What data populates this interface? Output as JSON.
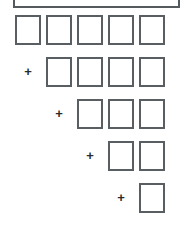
{
  "figure": {
    "type": "staircase-rectangle-diagram",
    "background_color": "#ffffff",
    "stroke_color": "#595e62",
    "plus_color": "#2b2b2b",
    "canvas": {
      "width": 189,
      "height": 228
    }
  },
  "top_bar": {
    "label": "",
    "x": 13,
    "y": -14,
    "width": 167,
    "height": 22,
    "cropped": "top"
  },
  "geometry": {
    "cell_width": 26,
    "cell_height": 30,
    "column_pitch": 31,
    "row_pitch": 42,
    "origin_x": 15,
    "origin_y": 15
  },
  "rows": [
    {
      "index": 0,
      "operator": "",
      "has_operator": false,
      "cell_count": 5,
      "column_offset": 0,
      "y": 15,
      "cells": [
        {
          "label": "",
          "column": 0
        },
        {
          "label": "",
          "column": 1
        },
        {
          "label": "",
          "column": 2
        },
        {
          "label": "",
          "column": 3
        },
        {
          "label": "",
          "column": 4
        }
      ]
    },
    {
      "index": 1,
      "operator": "+",
      "has_operator": true,
      "operator_x": 22,
      "cell_count": 4,
      "column_offset": 1,
      "y": 57,
      "cells": [
        {
          "label": "",
          "column": 1
        },
        {
          "label": "",
          "column": 2
        },
        {
          "label": "",
          "column": 3
        },
        {
          "label": "",
          "column": 4
        }
      ]
    },
    {
      "index": 2,
      "operator": "+",
      "has_operator": true,
      "operator_x": 53,
      "cell_count": 3,
      "column_offset": 2,
      "y": 99,
      "cells": [
        {
          "label": "",
          "column": 2
        },
        {
          "label": "",
          "column": 3
        },
        {
          "label": "",
          "column": 4
        }
      ]
    },
    {
      "index": 3,
      "operator": "+",
      "has_operator": true,
      "operator_x": 84,
      "cell_count": 2,
      "column_offset": 3,
      "y": 141,
      "cells": [
        {
          "label": "",
          "column": 3
        },
        {
          "label": "",
          "column": 4
        }
      ]
    },
    {
      "index": 4,
      "operator": "+",
      "has_operator": true,
      "operator_x": 115,
      "cell_count": 1,
      "column_offset": 4,
      "y": 183,
      "cells": [
        {
          "label": "",
          "column": 4
        }
      ]
    }
  ]
}
